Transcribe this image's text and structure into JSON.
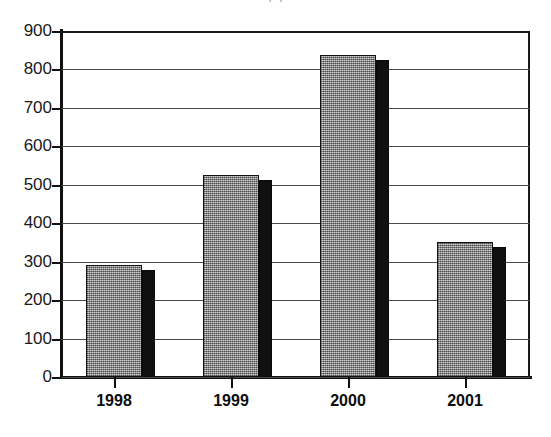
{
  "title_remnant": "(                    )",
  "chart_data": {
    "type": "bar",
    "title": "",
    "xlabel": "",
    "ylabel": "",
    "categories": [
      "1998",
      "1999",
      "2000",
      "2001"
    ],
    "values": [
      292,
      525,
      838,
      350
    ],
    "series": [
      {
        "name": "series-1",
        "values": [
          292,
          525,
          838,
          350
        ]
      }
    ],
    "ylim": [
      0,
      900
    ],
    "ytick_step": 100,
    "yticks": [
      0,
      100,
      200,
      300,
      400,
      500,
      600,
      700,
      800,
      900
    ],
    "ytick_labels": [
      "0",
      "100",
      "200",
      "300",
      "400",
      "500",
      "600",
      "700",
      "800",
      "900"
    ],
    "grid": true,
    "grid_axis": "y",
    "legend": false,
    "legend_position": "none",
    "bar_style": "3d-shadow",
    "colors": {
      "bar_face": "#9a9a9a",
      "bar_edge": "#111111",
      "bar_shadow": "#101010",
      "axis": "#111111",
      "gridline": "#4a4a4a",
      "background": "#ffffff",
      "text": "#0d0d0d"
    }
  }
}
